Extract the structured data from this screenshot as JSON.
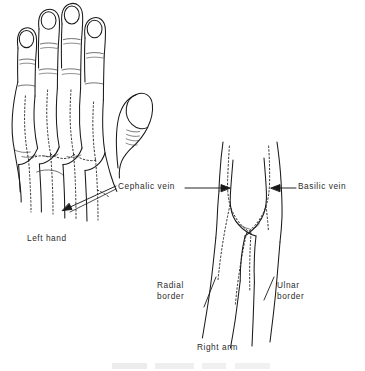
{
  "figure": {
    "style": "black ink line drawing on white",
    "ink_color": "#1a1a1a",
    "vein_style": "dotted line",
    "background": "#ffffff"
  },
  "labels": {
    "cephalic_vein": "Cephalic vein",
    "basilic_vein": "Basilic vein",
    "left_hand": "Left hand",
    "radial_border_line1": "Radial",
    "radial_border_line2": "border",
    "ulnar_border_line1": "Ulnar",
    "ulnar_border_line2": "border",
    "right_arm": "Right arm"
  },
  "structures": [
    {
      "name": "left-hand",
      "description": "dorsum of left hand, four fingers extended upward, thumb to the right, cut off at wrist"
    },
    {
      "name": "right-arm",
      "description": "right antecubital fossa with V-shaped vein junction, forearm tapering downward"
    },
    {
      "name": "cephalic-vein",
      "description": "runs along the radial (thumb) side"
    },
    {
      "name": "basilic-vein",
      "description": "runs along the ulnar (little finger) side"
    }
  ],
  "leaders": [
    {
      "name": "cephalic-to-hand",
      "type": "arrow",
      "direction": "down-left"
    },
    {
      "name": "cephalic-to-arm",
      "type": "arrow",
      "direction": "right"
    },
    {
      "name": "basilic-to-arm",
      "type": "arrow",
      "direction": "left"
    },
    {
      "name": "radial-border-leader",
      "type": "line",
      "direction": "diagonal"
    },
    {
      "name": "ulnar-border-leader",
      "type": "line",
      "direction": "diagonal"
    }
  ]
}
